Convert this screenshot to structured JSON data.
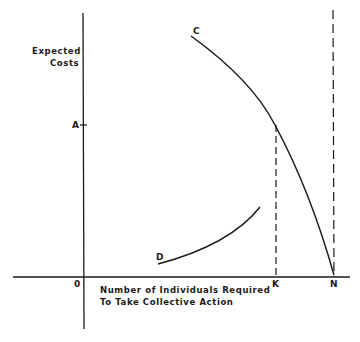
{
  "diagram": {
    "y_axis_title_line1": "Expected",
    "y_axis_title_line2": "Costs",
    "x_axis_title_line1": "Number of Individuals Required",
    "x_axis_title_line2": "To Take Collective Action",
    "origin_label": "0",
    "y_tick_label_A": "A",
    "x_tick_label_K": "K",
    "x_tick_label_N": "N",
    "curve_C_label": "C",
    "curve_D_label": "D",
    "line_color": "#1a1a1a",
    "background_color": "#ffffff"
  }
}
